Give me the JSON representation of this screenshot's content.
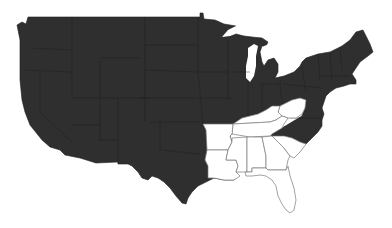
{
  "map": {
    "subject": "Contiguous United States choropleth (two-class)",
    "colors": {
      "highlighted": "#2f2f2f",
      "not_highlighted": "#ffffff",
      "state_border_light": "#7a7a7a",
      "background": "#ffffff"
    },
    "regions": [
      {
        "name": "Main dark region",
        "fill": "highlighted"
      },
      {
        "name": "Kentucky",
        "fill": "not_highlighted"
      },
      {
        "name": "West Virginia",
        "fill": "not_highlighted"
      },
      {
        "name": "Tennessee",
        "fill": "not_highlighted"
      },
      {
        "name": "Arkansas",
        "fill": "not_highlighted"
      },
      {
        "name": "Louisiana",
        "fill": "not_highlighted"
      },
      {
        "name": "Mississippi",
        "fill": "not_highlighted"
      },
      {
        "name": "Alabama",
        "fill": "not_highlighted"
      },
      {
        "name": "Georgia",
        "fill": "not_highlighted"
      },
      {
        "name": "South Carolina",
        "fill": "not_highlighted"
      },
      {
        "name": "Florida",
        "fill": "not_highlighted"
      }
    ]
  }
}
